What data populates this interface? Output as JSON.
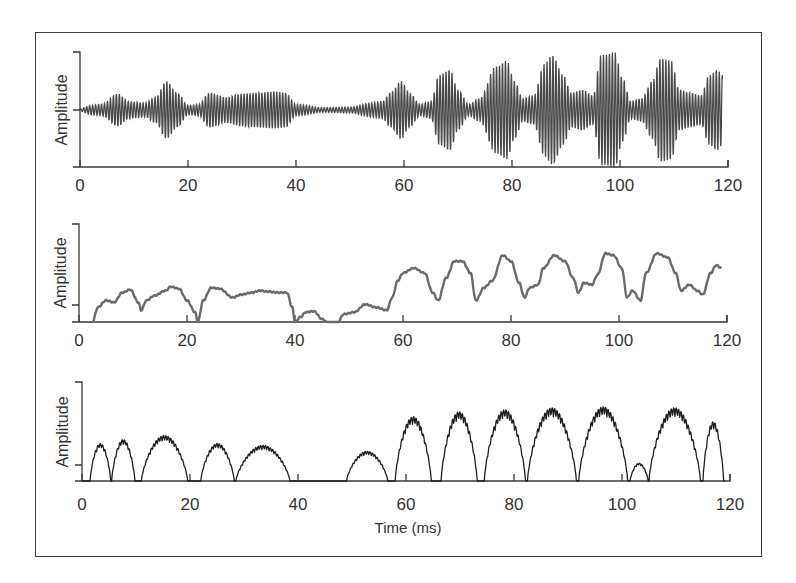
{
  "chart_data": [
    {
      "type": "line",
      "panel": "top",
      "title": "",
      "xlabel": "",
      "ylabel": "Amplitude",
      "xlim": [
        0,
        120
      ],
      "x_ticks": [
        0,
        20,
        40,
        60,
        80,
        100,
        120
      ],
      "y_ticks": [
        "",
        "",
        ""
      ],
      "description": "Raw waveform: amplitude-modulated carrier (~1.8 kHz) oscillating around zero; weak bursts 0-40 ms, near-silence 40-57 ms, strong periodic bursts every ~9.5 ms from 57-119 ms",
      "envelope_keypoints": {
        "t": [
          0,
          2,
          4,
          7,
          9,
          12,
          14,
          16,
          18,
          20,
          22,
          24,
          27,
          30,
          33,
          36,
          38,
          40,
          45,
          50,
          54,
          56,
          57.5,
          59.5,
          61,
          63,
          65,
          66.5,
          68.5,
          70,
          72,
          74,
          77,
          79,
          80.5,
          82,
          84,
          86,
          87.5,
          89.5,
          91,
          93,
          95,
          96.5,
          99,
          100.5,
          102,
          104,
          106,
          107.5,
          109.5,
          111,
          113,
          115,
          116.5,
          118,
          119
        ],
        "amp": [
          0.02,
          0.08,
          0.1,
          0.28,
          0.15,
          0.12,
          0.22,
          0.5,
          0.3,
          0.08,
          0.1,
          0.3,
          0.22,
          0.28,
          0.3,
          0.32,
          0.3,
          0.1,
          0.04,
          0.05,
          0.12,
          0.15,
          0.3,
          0.5,
          0.3,
          0.1,
          0.15,
          0.6,
          0.7,
          0.35,
          0.1,
          0.2,
          0.75,
          0.85,
          0.5,
          0.2,
          0.25,
          0.8,
          0.95,
          0.6,
          0.3,
          0.35,
          0.25,
          0.95,
          1.0,
          0.55,
          0.15,
          0.2,
          0.5,
          0.9,
          0.85,
          0.35,
          0.3,
          0.25,
          0.6,
          0.7,
          0.6
        ]
      },
      "carrier_period_ms": 0.55
    },
    {
      "type": "line",
      "panel": "middle",
      "title": "",
      "xlabel": "",
      "ylabel": "Amplitude",
      "xlim": [
        0,
        120
      ],
      "ylim": [
        0,
        1
      ],
      "x_ticks": [
        0,
        20,
        40,
        60,
        80,
        100,
        120
      ],
      "y_ticks": [
        "",
        "",
        ""
      ],
      "description": "Smoothed amplitude envelope (gray): humps ~every 9.5 ms, dropping to zero near 22, 40, and 45-48 ms",
      "x": [
        2.5,
        3.5,
        5,
        6.5,
        8,
        9.5,
        11,
        11.5,
        12.5,
        14,
        16,
        17,
        18.5,
        20,
        21.5,
        22,
        23,
        24.5,
        26,
        28.5,
        30,
        32,
        33.5,
        35,
        37,
        38.5,
        39.5,
        40,
        41,
        42,
        43.5,
        45,
        46,
        48,
        49,
        51,
        53,
        55,
        57,
        58,
        59,
        60,
        62,
        64,
        65.5,
        66.5,
        68,
        69.5,
        71,
        72.5,
        73.5,
        75,
        76.5,
        78.5,
        80,
        81.5,
        82.5,
        83.5,
        85,
        86,
        88,
        90,
        91.5,
        92.5,
        93.5,
        95,
        96,
        97.5,
        99,
        100.5,
        101.5,
        102.5,
        104,
        105,
        107,
        109,
        110.5,
        111.5,
        113,
        114.5,
        115.5,
        117,
        118,
        119
      ],
      "y": [
        0.0,
        0.15,
        0.22,
        0.2,
        0.3,
        0.33,
        0.2,
        0.12,
        0.22,
        0.27,
        0.32,
        0.36,
        0.34,
        0.22,
        0.1,
        0.0,
        0.22,
        0.35,
        0.34,
        0.25,
        0.28,
        0.3,
        0.32,
        0.31,
        0.3,
        0.3,
        0.15,
        0.0,
        0.05,
        0.1,
        0.11,
        0.03,
        0.0,
        0.0,
        0.08,
        0.1,
        0.18,
        0.15,
        0.12,
        0.25,
        0.42,
        0.5,
        0.55,
        0.5,
        0.3,
        0.22,
        0.45,
        0.62,
        0.62,
        0.5,
        0.22,
        0.35,
        0.42,
        0.68,
        0.62,
        0.4,
        0.25,
        0.35,
        0.38,
        0.55,
        0.68,
        0.62,
        0.45,
        0.3,
        0.4,
        0.38,
        0.48,
        0.7,
        0.68,
        0.55,
        0.25,
        0.32,
        0.22,
        0.5,
        0.7,
        0.66,
        0.5,
        0.32,
        0.38,
        0.32,
        0.28,
        0.5,
        0.58,
        0.55
      ]
    },
    {
      "type": "line",
      "panel": "bottom",
      "title": "",
      "xlabel": "Time (ms)",
      "ylabel": "Amplitude",
      "xlim": [
        0,
        120
      ],
      "ylim": [
        0,
        1
      ],
      "x_ticks": [
        0,
        20,
        40,
        60,
        80,
        100,
        120
      ],
      "y_ticks": [
        "",
        "",
        ""
      ],
      "description": "Rectified/half-wave envelope with fine ripple (black): humps every ~9.5 ms with jagged fine structure; silence 40-48 ms",
      "humps": [
        {
          "start": 1.5,
          "end": 5.5,
          "peak": 0.38
        },
        {
          "start": 5.5,
          "end": 10,
          "peak": 0.42
        },
        {
          "start": 11,
          "end": 20,
          "peak": 0.46
        },
        {
          "start": 22,
          "end": 28.5,
          "peak": 0.38
        },
        {
          "start": 28.5,
          "end": 39,
          "peak": 0.36
        },
        {
          "start": 49,
          "end": 57,
          "peak": 0.3
        },
        {
          "start": 58,
          "end": 65,
          "peak": 0.65
        },
        {
          "start": 66.5,
          "end": 73.5,
          "peak": 0.7
        },
        {
          "start": 74.5,
          "end": 82.5,
          "peak": 0.72
        },
        {
          "start": 82.5,
          "end": 92,
          "peak": 0.74
        },
        {
          "start": 92,
          "end": 101.5,
          "peak": 0.75
        },
        {
          "start": 101.5,
          "end": 105,
          "peak": 0.18
        },
        {
          "start": 105,
          "end": 115,
          "peak": 0.74
        },
        {
          "start": 115,
          "end": 119,
          "peak": 0.6
        }
      ]
    }
  ],
  "panels": [
    {
      "ylabel": "Amplitude",
      "x_tick_labels": [
        "0",
        "20",
        "40",
        "60",
        "80",
        "100",
        "120"
      ]
    },
    {
      "ylabel": "Amplitude",
      "x_tick_labels": [
        "0",
        "20",
        "40",
        "60",
        "80",
        "100",
        "120"
      ]
    },
    {
      "ylabel": "Amplitude",
      "x_tick_labels": [
        "0",
        "20",
        "40",
        "60",
        "80",
        "100",
        "120"
      ],
      "xlabel": "Time (ms)"
    }
  ],
  "colors": {
    "frame": "#3a3a3a",
    "top_trace": "#4a4a4a",
    "middle_trace": "#6a6a6a",
    "bottom_trace": "#1e1e1e"
  }
}
